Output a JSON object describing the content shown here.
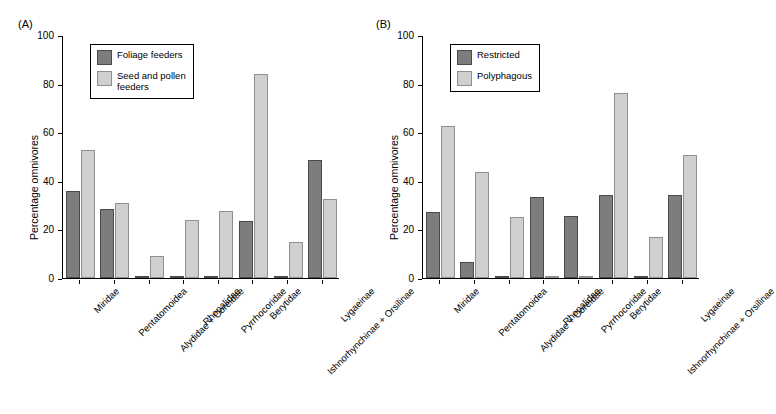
{
  "panels": [
    {
      "label": "(A)",
      "ylabel": "Percentage omnivores",
      "legend": [
        "Foliage feeders",
        "Seed and pollen\nfeeders"
      ],
      "chart_data": {
        "type": "bar",
        "title": "",
        "xlabel": "",
        "ylabel": "Percentage omnivores",
        "ylim": [
          0,
          100
        ],
        "yticks": [
          0,
          20,
          40,
          60,
          80,
          100
        ],
        "grid": false,
        "legend_position": "upper-left",
        "categories": [
          "Miridae",
          "Pentatomoidea",
          "Alydidae + Coreidae",
          "Rhopalidae",
          "Pyrrhocoridae",
          "Berytidae",
          "Ishnorhynchinae + Orsilinae",
          "Lygaeinae"
        ],
        "series": [
          {
            "name": "Foliage feeders",
            "values": [
              36,
              28.5,
              0.8,
              0.8,
              0.8,
              23.5,
              0.8,
              48.5
            ]
          },
          {
            "name": "Seed and pollen feeders",
            "values": [
              52.5,
              31,
              9,
              24,
              27.5,
              84,
              15,
              32.5
            ]
          }
        ]
      }
    },
    {
      "label": "(B)",
      "ylabel": "Percentage omnivores",
      "legend": [
        "Restricted",
        "Polyphagous"
      ],
      "chart_data": {
        "type": "bar",
        "title": "",
        "xlabel": "",
        "ylabel": "Percentage omnivores",
        "ylim": [
          0,
          100
        ],
        "yticks": [
          0,
          20,
          40,
          60,
          80,
          100
        ],
        "grid": false,
        "legend_position": "upper-left",
        "categories": [
          "Miridae",
          "Pentatomoidea",
          "Alydidae + Coreidae",
          "Rhopalidae",
          "Pyrrhocoridae",
          "Berytidae",
          "Ishnorhynchinae + Orsilinae",
          "Lygaeinae"
        ],
        "series": [
          {
            "name": "Restricted",
            "values": [
              27,
              6.5,
              0.8,
              33.5,
              25.5,
              34,
              0.8,
              34
            ]
          },
          {
            "name": "Polyphagous",
            "values": [
              62.5,
              43.5,
              25,
              0.8,
              0.8,
              76,
              17,
              50.5
            ]
          }
        ]
      }
    }
  ]
}
